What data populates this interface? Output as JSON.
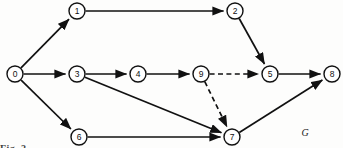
{
  "figure": {
    "graph_name": "G",
    "caption_fragment": "Fig. 2",
    "background_color": "#fdfdfc",
    "ink_color": "#111111"
  },
  "graph_data": {
    "type": "directed-graph",
    "directed": true,
    "node_radius": 8,
    "nodes": [
      {
        "id": "0",
        "label": "0",
        "x": 15,
        "y": 74
      },
      {
        "id": "1",
        "label": "1",
        "x": 77,
        "y": 11
      },
      {
        "id": "2",
        "label": "2",
        "x": 235,
        "y": 11
      },
      {
        "id": "3",
        "label": "3",
        "x": 77,
        "y": 74
      },
      {
        "id": "4",
        "label": "4",
        "x": 138,
        "y": 74
      },
      {
        "id": "9",
        "label": "9",
        "x": 201,
        "y": 74
      },
      {
        "id": "5",
        "label": "5",
        "x": 270,
        "y": 74
      },
      {
        "id": "8",
        "label": "8",
        "x": 332,
        "y": 74
      },
      {
        "id": "6",
        "label": "6",
        "x": 79,
        "y": 137
      },
      {
        "id": "7",
        "label": "7",
        "x": 232,
        "y": 137
      }
    ],
    "edges": [
      {
        "from": "0",
        "to": "1",
        "style": "solid",
        "arrow": true
      },
      {
        "from": "0",
        "to": "3",
        "style": "solid",
        "arrow": true
      },
      {
        "from": "0",
        "to": "6",
        "style": "solid",
        "arrow": true
      },
      {
        "from": "1",
        "to": "2",
        "style": "solid",
        "arrow": true
      },
      {
        "from": "2",
        "to": "5",
        "style": "solid",
        "arrow": true
      },
      {
        "from": "3",
        "to": "4",
        "style": "solid",
        "arrow": true
      },
      {
        "from": "3",
        "to": "7",
        "style": "solid",
        "arrow": true
      },
      {
        "from": "4",
        "to": "9",
        "style": "solid",
        "arrow": true
      },
      {
        "from": "9",
        "to": "5",
        "style": "dashed",
        "arrow": true
      },
      {
        "from": "9",
        "to": "7",
        "style": "dashed",
        "arrow": true
      },
      {
        "from": "6",
        "to": "7",
        "style": "solid",
        "arrow": true
      },
      {
        "from": "5",
        "to": "8",
        "style": "solid",
        "arrow": true
      },
      {
        "from": "7",
        "to": "8",
        "style": "solid",
        "arrow": true
      }
    ],
    "graph_label": "G",
    "graph_label_x": 305,
    "graph_label_y": 132
  }
}
